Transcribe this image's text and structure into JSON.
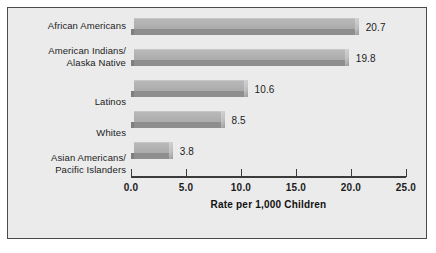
{
  "chart_data": {
    "type": "bar",
    "orientation": "horizontal",
    "title": "",
    "xlabel": "Rate per 1,000 Children",
    "ylabel": "",
    "xlim": [
      0.0,
      25.0
    ],
    "xticks": [
      "0.0",
      "5.0",
      "10.0",
      "15.0",
      "20.0",
      "25.0"
    ],
    "xtick_values": [
      0,
      5,
      10,
      15,
      20,
      25
    ],
    "grid": false,
    "legend": "none",
    "categories": [
      "African Americans",
      "American Indians/\nAlaska Native",
      "Latinos",
      "Whites",
      "Asian Americans/\nPacific Islanders"
    ],
    "values": [
      20.7,
      19.8,
      10.6,
      8.5,
      3.8
    ],
    "value_labels": [
      "20.7",
      "19.8",
      "10.6",
      "8.5",
      "3.8"
    ],
    "bars": [
      {
        "label_line1": "African Americans",
        "label_line2": "",
        "value": 20.7,
        "value_label": "20.7"
      },
      {
        "label_line1": "American Indians/",
        "label_line2": "Alaska Native",
        "value": 19.8,
        "value_label": "19.8"
      },
      {
        "label_line1": "Latinos",
        "label_line2": "",
        "value": 10.6,
        "value_label": "10.6"
      },
      {
        "label_line1": "Whites",
        "label_line2": "",
        "value": 8.5,
        "value_label": "8.5"
      },
      {
        "label_line1": "Asian Americans/",
        "label_line2": "Pacific Islanders",
        "value": 3.8,
        "value_label": "3.8"
      }
    ],
    "colors": {
      "bar_top": "#b3b3b3",
      "bar_bottom": "#8e8e8e",
      "panel_background": "#ebebeb",
      "panel_border": "#4a4a4a",
      "axis": "#3b3b3b",
      "text": "#1b1b1b"
    }
  }
}
